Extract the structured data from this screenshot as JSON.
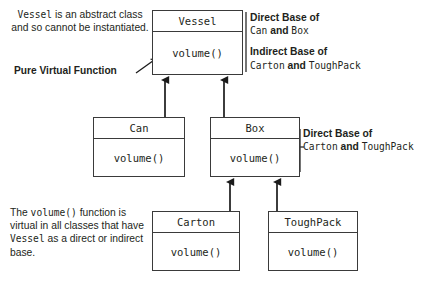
{
  "diagram": {
    "type": "uml-class-inheritance",
    "line_color": "#3a3a3a",
    "text_color": "#231f20",
    "background": "#ffffff"
  },
  "classes": {
    "vessel": {
      "name": "Vessel",
      "member": "volume()"
    },
    "can": {
      "name": "Can",
      "member": "volume()"
    },
    "box": {
      "name": "Box",
      "member": "volume()"
    },
    "carton": {
      "name": "Carton",
      "member": "volume()"
    },
    "toughpack": {
      "name": "ToughPack",
      "member": "volume()"
    }
  },
  "notes": {
    "abstract": {
      "part1_mono": "Vessel",
      "part2": " is an abstract class and so cannot be instantiated."
    },
    "pure_virtual": {
      "label": "Pure Virtual Function"
    },
    "vessel_bases": {
      "direct_heading": "Direct Base of",
      "direct_a": "Can",
      "direct_joiner": " and ",
      "direct_b": "Box",
      "indirect_heading": "Indirect Base of",
      "indirect_a": "Carton",
      "indirect_joiner": " and ",
      "indirect_b": "ToughPack"
    },
    "box_bases": {
      "heading": "Direct Base of",
      "a": "Carton",
      "joiner": " and ",
      "b": "ToughPack"
    },
    "virtual_all": {
      "lead": "The ",
      "fn_mono": "volume()",
      "mid": " function is virtual in all classes that have ",
      "cls_mono": "Vessel",
      "tail": " as a direct or indirect base."
    }
  }
}
